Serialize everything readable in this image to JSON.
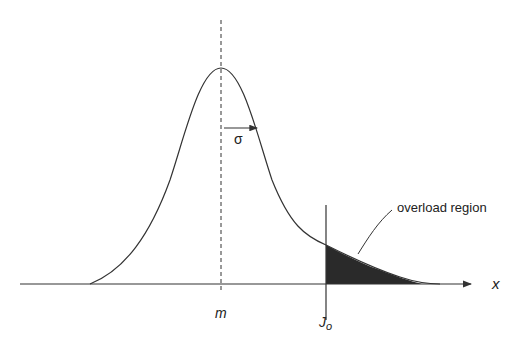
{
  "diagram": {
    "type": "normal-distribution-overload",
    "labels": {
      "x_axis": "x",
      "mean": "m",
      "sigma": "σ",
      "threshold_main": "J",
      "threshold_sub": "o",
      "region": "overload region"
    },
    "colors": {
      "line": "#333333",
      "shade": "#2a2a2a",
      "background": "#ffffff"
    },
    "geometry": {
      "baseline_y": 284,
      "axis_start_x": 20,
      "axis_end_x": 472,
      "mean_x": 221,
      "peak_y": 68,
      "sigma_px": 57,
      "threshold_x": 326
    }
  }
}
